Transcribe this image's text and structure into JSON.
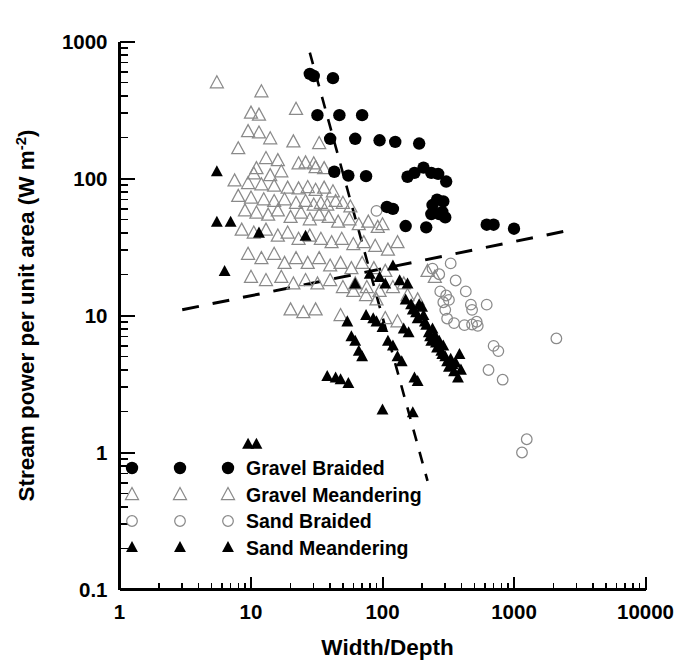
{
  "chart_data": {
    "type": "scatter",
    "title": "",
    "xlabel": "Width/Depth",
    "ylabel": "Stream power per unit area (W m-2)",
    "ylabel_main": "Stream power per unit area (W m",
    "ylabel_sup": "-2",
    "ylabel_tail": ")",
    "xscale": "log",
    "yscale": "log",
    "xlim": [
      1,
      10000
    ],
    "ylim": [
      0.1,
      1000
    ],
    "xticks": [
      1,
      10,
      100,
      1000,
      10000
    ],
    "xtick_labels": [
      "1",
      "10",
      "100",
      "1000",
      "10000"
    ],
    "yticks": [
      0.1,
      1,
      10,
      100,
      1000
    ],
    "ytick_labels": [
      "0.1",
      "1",
      "10",
      "100",
      "1000"
    ],
    "grid": false,
    "legend_position": "inside-lower-left",
    "series": [
      {
        "name": "Gravel Braided",
        "marker": "filled-circle",
        "color": "#000000",
        "points": [
          [
            28,
            580
          ],
          [
            30,
            560
          ],
          [
            42,
            540
          ],
          [
            32,
            290
          ],
          [
            47,
            290
          ],
          [
            70,
            290
          ],
          [
            40,
            195
          ],
          [
            62,
            195
          ],
          [
            95,
            190
          ],
          [
            125,
            185
          ],
          [
            190,
            180
          ],
          [
            43,
            112
          ],
          [
            55,
            105
          ],
          [
            75,
            104
          ],
          [
            155,
            103
          ],
          [
            175,
            110
          ],
          [
            235,
            110
          ],
          [
            205,
            120
          ],
          [
            265,
            108
          ],
          [
            305,
            95
          ],
          [
            240,
            64
          ],
          [
            260,
            70
          ],
          [
            290,
            68
          ],
          [
            235,
            55
          ],
          [
            270,
            55
          ],
          [
            285,
            57
          ],
          [
            300,
            52
          ],
          [
            150,
            45
          ],
          [
            215,
            44
          ],
          [
            620,
            46
          ],
          [
            700,
            46
          ],
          [
            1000,
            43
          ],
          [
            108,
            62
          ],
          [
            120,
            60
          ]
        ]
      },
      {
        "name": "Gravel Meandering",
        "marker": "open-triangle",
        "color": "#8a8a8a",
        "points": [
          [
            5.5,
            500
          ],
          [
            12,
            430
          ],
          [
            22,
            320
          ],
          [
            10,
            300
          ],
          [
            11.5,
            290
          ],
          [
            9.5,
            220
          ],
          [
            11.5,
            215
          ],
          [
            14,
            195
          ],
          [
            21,
            185
          ],
          [
            33,
            180
          ],
          [
            8,
            165
          ],
          [
            13,
            140
          ],
          [
            16,
            135
          ],
          [
            23,
            128
          ],
          [
            26,
            130
          ],
          [
            30,
            128
          ],
          [
            11,
            118
          ],
          [
            17,
            112
          ],
          [
            10.5,
            108
          ],
          [
            14,
            105
          ],
          [
            31,
            120
          ],
          [
            36,
            118
          ],
          [
            7.5,
            96
          ],
          [
            9.5,
            92
          ],
          [
            12,
            90
          ],
          [
            15,
            88
          ],
          [
            19,
            85
          ],
          [
            23,
            84
          ],
          [
            27,
            86
          ],
          [
            31,
            82
          ],
          [
            36,
            85
          ],
          [
            42,
            80
          ],
          [
            8,
            74
          ],
          [
            10,
            72
          ],
          [
            12.5,
            70
          ],
          [
            15,
            68
          ],
          [
            18,
            70
          ],
          [
            22,
            66
          ],
          [
            26,
            68
          ],
          [
            30,
            64
          ],
          [
            34,
            66
          ],
          [
            38,
            64
          ],
          [
            44,
            68
          ],
          [
            50,
            66
          ],
          [
            57,
            62
          ],
          [
            9,
            58
          ],
          [
            11,
            56
          ],
          [
            13.5,
            54
          ],
          [
            16,
            58
          ],
          [
            20,
            52
          ],
          [
            24,
            56
          ],
          [
            28,
            50
          ],
          [
            33,
            54
          ],
          [
            39,
            52
          ],
          [
            46,
            48
          ],
          [
            56,
            50
          ],
          [
            66,
            46
          ],
          [
            78,
            48
          ],
          [
            92,
            44
          ],
          [
            100,
            46
          ],
          [
            8.5,
            42
          ],
          [
            10.5,
            40
          ],
          [
            13,
            42
          ],
          [
            16,
            38
          ],
          [
            19,
            40
          ],
          [
            23,
            36
          ],
          [
            28,
            38
          ],
          [
            34,
            36
          ],
          [
            41,
            34
          ],
          [
            49,
            36
          ],
          [
            60,
            33
          ],
          [
            72,
            34
          ],
          [
            88,
            32
          ],
          [
            110,
            30
          ],
          [
            130,
            34
          ],
          [
            9.5,
            28
          ],
          [
            12,
            26
          ],
          [
            15,
            28
          ],
          [
            18,
            24
          ],
          [
            22,
            26
          ],
          [
            27,
            24
          ],
          [
            33,
            26
          ],
          [
            40,
            23
          ],
          [
            48,
            24
          ],
          [
            58,
            22
          ],
          [
            70,
            24
          ],
          [
            86,
            22
          ],
          [
            105,
            21
          ],
          [
            10,
            19
          ],
          [
            13,
            18
          ],
          [
            17,
            19
          ],
          [
            21,
            17
          ],
          [
            26,
            18
          ],
          [
            32,
            17
          ],
          [
            40,
            18
          ],
          [
            50,
            16
          ],
          [
            62,
            17
          ],
          [
            76,
            16
          ],
          [
            95,
            15
          ],
          [
            120,
            16
          ],
          [
            145,
            17
          ],
          [
            20,
            11
          ],
          [
            25,
            10.5
          ],
          [
            31,
            11
          ],
          [
            48,
            10
          ],
          [
            60,
            15
          ],
          [
            75,
            14
          ],
          [
            90,
            13
          ],
          [
            155,
            14
          ],
          [
            185,
            13
          ],
          [
            105,
            9.5
          ],
          [
            130,
            9
          ],
          [
            220,
            21
          ],
          [
            250,
            19
          ]
        ]
      },
      {
        "name": "Sand Braided",
        "marker": "open-circle",
        "color": "#8a8a8a",
        "points": [
          [
            90,
            58
          ],
          [
            240,
            22
          ],
          [
            270,
            20
          ],
          [
            330,
            24
          ],
          [
            360,
            18
          ],
          [
            275,
            15
          ],
          [
            305,
            14
          ],
          [
            320,
            13
          ],
          [
            290,
            12.5
          ],
          [
            300,
            11
          ],
          [
            430,
            15
          ],
          [
            470,
            12
          ],
          [
            480,
            11
          ],
          [
            620,
            12
          ],
          [
            520,
            9
          ],
          [
            700,
            6
          ],
          [
            760,
            5.5
          ],
          [
            640,
            4
          ],
          [
            820,
            3.4
          ],
          [
            2100,
            6.8
          ],
          [
            1250,
            1.25
          ],
          [
            1150,
            1.0
          ],
          [
            420,
            8.5
          ],
          [
            480,
            8.6
          ],
          [
            530,
            8.4
          ],
          [
            310,
            9.5
          ],
          [
            350,
            8.8
          ]
        ]
      },
      {
        "name": "Sand Meandering",
        "marker": "filled-triangle",
        "color": "#000000",
        "points": [
          [
            5.5,
            112
          ],
          [
            5.5,
            48
          ],
          [
            7,
            48
          ],
          [
            11.5,
            40
          ],
          [
            26,
            38
          ],
          [
            6.3,
            21
          ],
          [
            62,
            17
          ],
          [
            80,
            20
          ],
          [
            95,
            19
          ],
          [
            105,
            17
          ],
          [
            120,
            23
          ],
          [
            135,
            18
          ],
          [
            155,
            17
          ],
          [
            150,
            13
          ],
          [
            165,
            12
          ],
          [
            170,
            11
          ],
          [
            180,
            10.5
          ],
          [
            185,
            9.5
          ],
          [
            190,
            12
          ],
          [
            200,
            11.5
          ],
          [
            205,
            10
          ],
          [
            210,
            9
          ],
          [
            215,
            8.5
          ],
          [
            225,
            7.5
          ],
          [
            230,
            7
          ],
          [
            235,
            6.5
          ],
          [
            240,
            8
          ],
          [
            250,
            7.2
          ],
          [
            255,
            6.3
          ],
          [
            260,
            5.8
          ],
          [
            270,
            6.5
          ],
          [
            280,
            5.5
          ],
          [
            285,
            5.2
          ],
          [
            290,
            6.0
          ],
          [
            300,
            5.0
          ],
          [
            310,
            4.6
          ],
          [
            320,
            4.2
          ],
          [
            330,
            4.8
          ],
          [
            340,
            4.4
          ],
          [
            350,
            3.9
          ],
          [
            360,
            4.5
          ],
          [
            110,
            6.5
          ],
          [
            120,
            6.0
          ],
          [
            90,
            9.0
          ],
          [
            100,
            8.2
          ],
          [
            75,
            10
          ],
          [
            85,
            9.5
          ],
          [
            130,
            5.0
          ],
          [
            140,
            4.6
          ],
          [
            145,
            8.0
          ],
          [
            158,
            7.5
          ],
          [
            66,
            5.5
          ],
          [
            70,
            5.0
          ],
          [
            58,
            7.0
          ],
          [
            62,
            6.5
          ],
          [
            54,
            9.0
          ],
          [
            9.5,
            1.15
          ],
          [
            11,
            1.15
          ],
          [
            38,
            3.6
          ],
          [
            44,
            3.5
          ],
          [
            48,
            3.4
          ],
          [
            55,
            3.2
          ],
          [
            100,
            2.05
          ],
          [
            170,
            1.95
          ],
          [
            175,
            3.5
          ],
          [
            185,
            3.3
          ],
          [
            375,
            3.5
          ],
          [
            385,
            5.2
          ],
          [
            395,
            4.0
          ]
        ]
      }
    ]
  },
  "legend": {
    "entries": [
      {
        "label": "Gravel Braided",
        "marker": "filled-circle"
      },
      {
        "label": "Gravel Meandering",
        "marker": "open-triangle"
      },
      {
        "label": "Sand Braided",
        "marker": "open-circle"
      },
      {
        "label": "Sand Meandering",
        "marker": "filled-triangle"
      }
    ]
  },
  "trendlines": [
    {
      "name": "shallow-threshold-line",
      "x1": 3.0,
      "y1": 11.0,
      "x2": 3000,
      "y2": 43.0,
      "dash": "17 14",
      "width": 3.0
    },
    {
      "name": "steep-threshold-line",
      "x1": 28,
      "y1": 830,
      "x2": 220,
      "y2": 0.62,
      "dash": "12 11",
      "width": 2.6
    }
  ]
}
